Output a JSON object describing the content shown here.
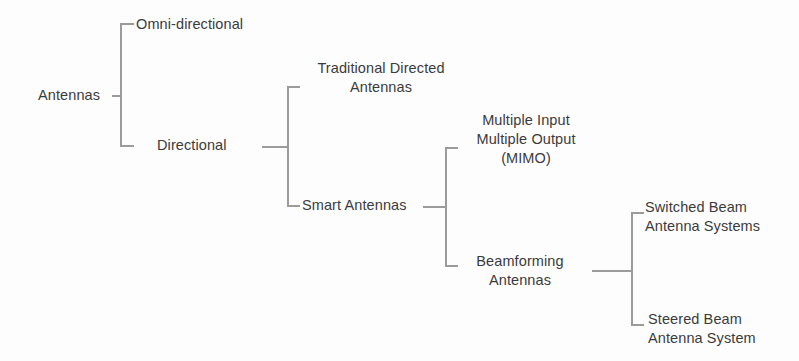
{
  "diagram": {
    "type": "tree",
    "orientation": "left-to-right",
    "line_color": "#9b9b9b",
    "text_color": "#3b3b3b",
    "background": "#fdfdfd",
    "nodes": {
      "root": "Antennas",
      "omni_directional": "Omni-directional",
      "directional": "Directional",
      "traditional_directed_antennas": "Traditional Directed\nAntennas",
      "smart_antennas": "Smart Antennas",
      "mimo": "Multiple Input\nMultiple Output\n(MIMO)",
      "beamforming_antennas": "Beamforming\nAntennas",
      "switched_beam": "Switched Beam\nAntenna Systems",
      "steered_beam": "Steered Beam\nAntenna System"
    },
    "hierarchy": [
      {
        "label": "Antennas",
        "children": [
          {
            "label": "Omni-directional",
            "children": []
          },
          {
            "label": "Directional",
            "children": [
              {
                "label": "Traditional Directed Antennas",
                "children": []
              },
              {
                "label": "Smart Antennas",
                "children": [
                  {
                    "label": "Multiple Input Multiple Output (MIMO)",
                    "children": []
                  },
                  {
                    "label": "Beamforming Antennas",
                    "children": [
                      {
                        "label": "Switched Beam Antenna Systems",
                        "children": []
                      },
                      {
                        "label": "Steered Beam Antenna System",
                        "children": []
                      }
                    ]
                  }
                ]
              }
            ]
          }
        ]
      }
    ]
  }
}
